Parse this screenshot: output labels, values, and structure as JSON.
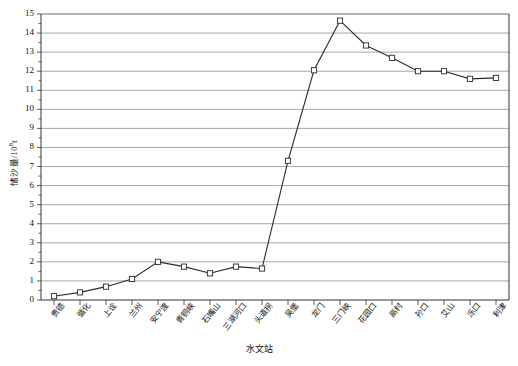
{
  "chart_data": {
    "type": "line",
    "title": "",
    "xlabel": "水文站",
    "ylabel": "储沙量/10",
    "ylabel_sup": "8",
    "ylabel_unit": "t",
    "ylabel_full": "储沙量/10⁸t",
    "categories": [
      "贵德",
      "循化",
      "上诠",
      "兰州",
      "安宁渡",
      "青铜峡",
      "石嘴山",
      "三湖河口",
      "头道拐",
      "吴堡",
      "龙门",
      "三门峡",
      "花园口",
      "高村",
      "孙口",
      "艾山",
      "泺口",
      "利津"
    ],
    "values": [
      0.2,
      0.4,
      0.7,
      1.1,
      2.0,
      1.75,
      1.4,
      1.75,
      1.65,
      7.3,
      12.05,
      14.65,
      13.35,
      12.7,
      12.0,
      12.0,
      11.6,
      11.65
    ],
    "ylim": [
      0,
      15
    ],
    "yticks": [
      0,
      1,
      2,
      3,
      4,
      5,
      6,
      7,
      8,
      9,
      10,
      11,
      12,
      13,
      14,
      15
    ],
    "ytick_labels": [
      "0",
      "1",
      "2",
      "3",
      "4",
      "5",
      "6",
      "7",
      "8",
      "9",
      "10",
      "11",
      "12",
      "13",
      "14",
      "15"
    ],
    "minor_tick_step": 0.5,
    "grid": true,
    "grid_axis": "y",
    "legend": "none",
    "marker": "square-open",
    "line_color": "#2b2b2b",
    "grid_color": "#808080",
    "axis_color": "#333333",
    "marker_fill": "#ffffff"
  }
}
